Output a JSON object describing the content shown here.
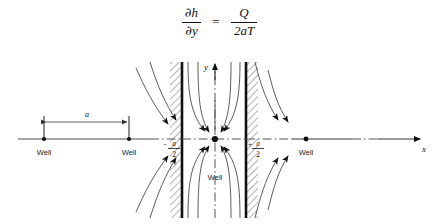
{
  "figure": {
    "type": "hydrogeology-flow-net-diagram",
    "equation": {
      "lhs_num_partial": "∂",
      "lhs_num_var": "h",
      "lhs_den_partial": "∂",
      "lhs_den_var": "y",
      "equals": "=",
      "rhs_num": "Q",
      "rhs_den": "2aT",
      "plain": "∂h/∂y = Q/2aT"
    },
    "axes": {
      "x_label": "x",
      "y_label": "y",
      "origin_x": 215,
      "origin_y": 139
    },
    "boundaries": [
      {
        "name": "left-impermeable-boundary",
        "label_sign": "-",
        "label_num": "a",
        "label_den": "2",
        "x": 182,
        "hatch_side": "left"
      },
      {
        "name": "right-impermeable-boundary",
        "label_sign": "+",
        "label_num": "a",
        "label_den": "2",
        "x": 246,
        "hatch_side": "right"
      }
    ],
    "dimension": {
      "label": "a",
      "from_x": 44,
      "to_x": 129,
      "y": 122
    },
    "wells": [
      {
        "name": "well-left-image",
        "label": "Well",
        "x": 44,
        "y": 139,
        "label_pos": "below"
      },
      {
        "name": "well-left-inner",
        "label": "Well",
        "x": 129,
        "y": 139,
        "label_pos": "below"
      },
      {
        "name": "well-center-real",
        "label": "Well",
        "x": 215,
        "y": 139,
        "label_pos": "below-inside"
      },
      {
        "name": "well-right-image",
        "label": "Well",
        "x": 306,
        "y": 139,
        "label_pos": "below"
      }
    ],
    "colors": {
      "ink": "#1a1a1a",
      "wall": "#111111",
      "flow_line": "#4a4a4a",
      "axis": "#4d4d4d",
      "background": "#ffffff"
    }
  }
}
